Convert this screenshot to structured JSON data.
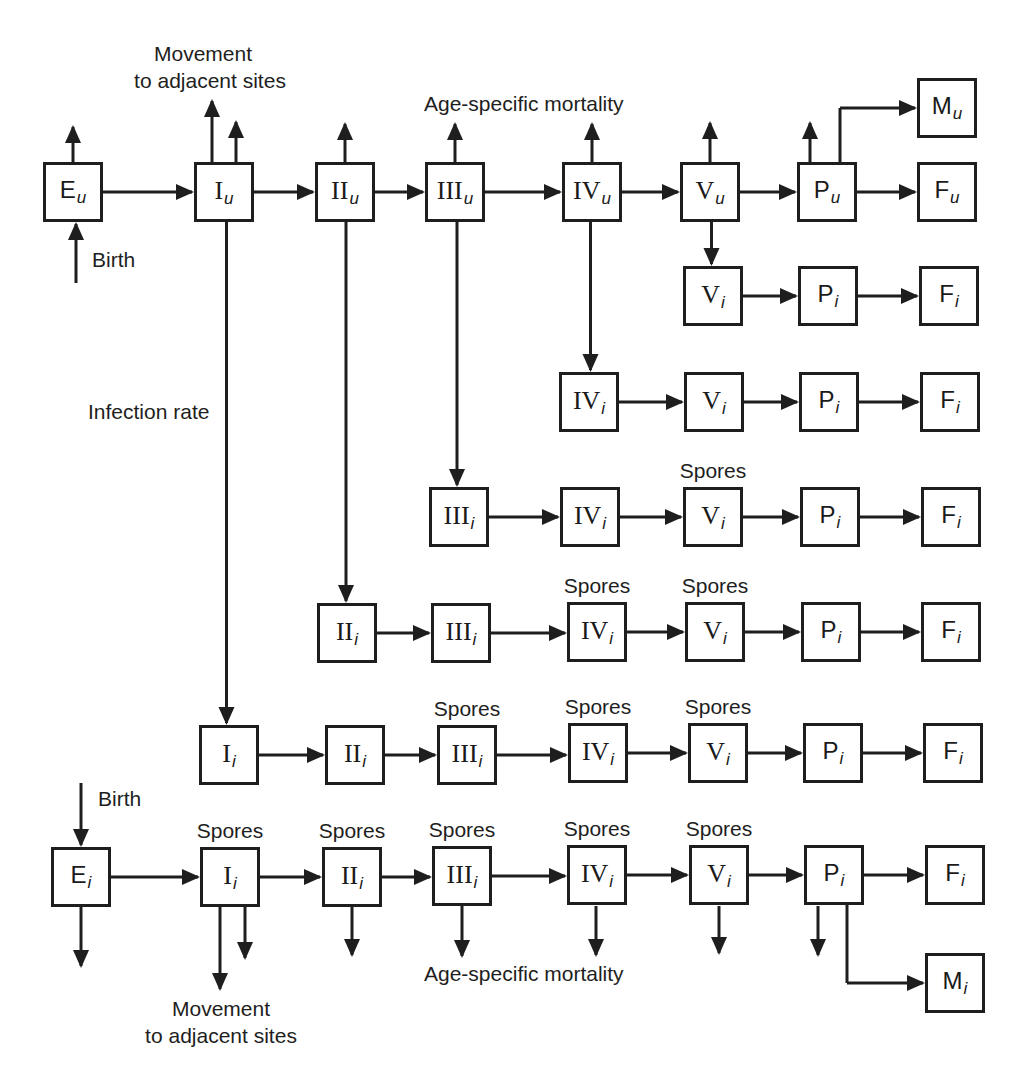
{
  "diagram": {
    "type": "compartment-flow",
    "labels": {
      "movement_top_1": "Movement",
      "movement_top_2": "to adjacent sites",
      "movement_bottom_1": "Movement",
      "movement_bottom_2": "to adjacent sites",
      "mortality_top": "Age-specific mortality",
      "mortality_bottom": "Age-specific mortality",
      "birth_top": "Birth",
      "birth_bottom": "Birth",
      "infection_rate": "Infection rate",
      "spores": "Spores"
    },
    "nodes": [
      {
        "id": "Eu",
        "main": "E",
        "sub": "u",
        "roman": false,
        "x": 73,
        "y": 192
      },
      {
        "id": "Iu",
        "main": "I",
        "sub": "u",
        "roman": true,
        "x": 224,
        "y": 192
      },
      {
        "id": "IIu",
        "main": "II",
        "sub": "u",
        "roman": true,
        "x": 345,
        "y": 192
      },
      {
        "id": "IIIu",
        "main": "III",
        "sub": "u",
        "roman": true,
        "x": 455,
        "y": 192
      },
      {
        "id": "IVu",
        "main": "IV",
        "sub": "u",
        "roman": true,
        "x": 592,
        "y": 192
      },
      {
        "id": "Vu",
        "main": "V",
        "sub": "u",
        "roman": true,
        "x": 710,
        "y": 192
      },
      {
        "id": "Pu",
        "main": "P",
        "sub": "u",
        "roman": false,
        "x": 827,
        "y": 192
      },
      {
        "id": "Fu",
        "main": "F",
        "sub": "u",
        "roman": false,
        "x": 947,
        "y": 192
      },
      {
        "id": "Mu",
        "main": "M",
        "sub": "u",
        "roman": false,
        "x": 947,
        "y": 108
      },
      {
        "id": "r2V",
        "main": "V",
        "sub": "i",
        "roman": true,
        "x": 713,
        "y": 296
      },
      {
        "id": "r2P",
        "main": "P",
        "sub": "i",
        "roman": false,
        "x": 828,
        "y": 296
      },
      {
        "id": "r2F",
        "main": "F",
        "sub": "i",
        "roman": false,
        "x": 949,
        "y": 296
      },
      {
        "id": "r3IV",
        "main": "IV",
        "sub": "i",
        "roman": true,
        "x": 589,
        "y": 402
      },
      {
        "id": "r3V",
        "main": "V",
        "sub": "i",
        "roman": true,
        "x": 714,
        "y": 402
      },
      {
        "id": "r3P",
        "main": "P",
        "sub": "i",
        "roman": false,
        "x": 829,
        "y": 402
      },
      {
        "id": "r3F",
        "main": "F",
        "sub": "i",
        "roman": false,
        "x": 950,
        "y": 402
      },
      {
        "id": "r4III",
        "main": "III",
        "sub": "i",
        "roman": true,
        "x": 459,
        "y": 517
      },
      {
        "id": "r4IV",
        "main": "IV",
        "sub": "i",
        "roman": true,
        "x": 590,
        "y": 517
      },
      {
        "id": "r4V",
        "main": "V",
        "sub": "i",
        "roman": true,
        "x": 713,
        "y": 517
      },
      {
        "id": "r4P",
        "main": "P",
        "sub": "i",
        "roman": false,
        "x": 830,
        "y": 517
      },
      {
        "id": "r4F",
        "main": "F",
        "sub": "i",
        "roman": false,
        "x": 951,
        "y": 517
      },
      {
        "id": "r5II",
        "main": "II",
        "sub": "i",
        "roman": true,
        "x": 347,
        "y": 633
      },
      {
        "id": "r5III",
        "main": "III",
        "sub": "i",
        "roman": true,
        "x": 461,
        "y": 633
      },
      {
        "id": "r5IV",
        "main": "IV",
        "sub": "i",
        "roman": true,
        "x": 597,
        "y": 632
      },
      {
        "id": "r5V",
        "main": "V",
        "sub": "i",
        "roman": true,
        "x": 715,
        "y": 632
      },
      {
        "id": "r5P",
        "main": "P",
        "sub": "i",
        "roman": false,
        "x": 831,
        "y": 632
      },
      {
        "id": "r5F",
        "main": "F",
        "sub": "i",
        "roman": false,
        "x": 951,
        "y": 632
      },
      {
        "id": "r6I",
        "main": "I",
        "sub": "i",
        "roman": true,
        "x": 229,
        "y": 755
      },
      {
        "id": "r6II",
        "main": "II",
        "sub": "i",
        "roman": true,
        "x": 355,
        "y": 755
      },
      {
        "id": "r6III",
        "main": "III",
        "sub": "i",
        "roman": true,
        "x": 467,
        "y": 755
      },
      {
        "id": "r6IV",
        "main": "IV",
        "sub": "i",
        "roman": true,
        "x": 598,
        "y": 753
      },
      {
        "id": "r6V",
        "main": "V",
        "sub": "i",
        "roman": true,
        "x": 718,
        "y": 753
      },
      {
        "id": "r6P",
        "main": "P",
        "sub": "i",
        "roman": false,
        "x": 833,
        "y": 753
      },
      {
        "id": "r6F",
        "main": "F",
        "sub": "i",
        "roman": false,
        "x": 953,
        "y": 753
      },
      {
        "id": "Ei",
        "main": "E",
        "sub": "i",
        "roman": false,
        "x": 81,
        "y": 877
      },
      {
        "id": "r7I",
        "main": "I",
        "sub": "i",
        "roman": true,
        "x": 230,
        "y": 877
      },
      {
        "id": "r7II",
        "main": "II",
        "sub": "i",
        "roman": true,
        "x": 352,
        "y": 877
      },
      {
        "id": "r7III",
        "main": "III",
        "sub": "i",
        "roman": true,
        "x": 462,
        "y": 876
      },
      {
        "id": "r7IV",
        "main": "IV",
        "sub": "i",
        "roman": true,
        "x": 597,
        "y": 875
      },
      {
        "id": "r7V",
        "main": "V",
        "sub": "i",
        "roman": true,
        "x": 719,
        "y": 875
      },
      {
        "id": "r7P",
        "main": "P",
        "sub": "i",
        "roman": false,
        "x": 834,
        "y": 875
      },
      {
        "id": "r7F",
        "main": "F",
        "sub": "i",
        "roman": false,
        "x": 955,
        "y": 875
      },
      {
        "id": "Mi",
        "main": "M",
        "sub": "i",
        "roman": false,
        "x": 955,
        "y": 983
      }
    ],
    "spores_above": [
      "r4V",
      "r5IV",
      "r5V",
      "r6III",
      "r6IV",
      "r6V",
      "r7I",
      "r7II",
      "r7III",
      "r7IV",
      "r7V"
    ],
    "edges": [
      [
        "Eu",
        "Iu"
      ],
      [
        "Iu",
        "IIu"
      ],
      [
        "IIu",
        "IIIu"
      ],
      [
        "IIIu",
        "IVu"
      ],
      [
        "IVu",
        "Vu"
      ],
      [
        "Vu",
        "Pu"
      ],
      [
        "Pu",
        "Fu"
      ],
      [
        "r2V",
        "r2P"
      ],
      [
        "r2P",
        "r2F"
      ],
      [
        "r3IV",
        "r3V"
      ],
      [
        "r3V",
        "r3P"
      ],
      [
        "r3P",
        "r3F"
      ],
      [
        "r4III",
        "r4IV"
      ],
      [
        "r4IV",
        "r4V"
      ],
      [
        "r4V",
        "r4P"
      ],
      [
        "r4P",
        "r4F"
      ],
      [
        "r5II",
        "r5III"
      ],
      [
        "r5III",
        "r5IV"
      ],
      [
        "r5IV",
        "r5V"
      ],
      [
        "r5V",
        "r5P"
      ],
      [
        "r5P",
        "r5F"
      ],
      [
        "r6I",
        "r6II"
      ],
      [
        "r6II",
        "r6III"
      ],
      [
        "r6III",
        "r6IV"
      ],
      [
        "r6IV",
        "r6V"
      ],
      [
        "r6V",
        "r6P"
      ],
      [
        "r6P",
        "r6F"
      ],
      [
        "Ei",
        "r7I"
      ],
      [
        "r7I",
        "r7II"
      ],
      [
        "r7II",
        "r7III"
      ],
      [
        "r7III",
        "r7IV"
      ],
      [
        "r7IV",
        "r7V"
      ],
      [
        "r7V",
        "r7P"
      ],
      [
        "r7P",
        "r7F"
      ]
    ],
    "infection_edges": [
      [
        "Iu",
        "r6I"
      ],
      [
        "IIu",
        "r5II"
      ],
      [
        "IIIu",
        "r4III"
      ],
      [
        "IVu",
        "r3IV"
      ],
      [
        "Vu",
        "r2V"
      ]
    ],
    "branch_edges": [
      [
        "Pu",
        "Mu"
      ],
      [
        "r7P",
        "Mi"
      ]
    ],
    "colors": {
      "stroke": "#1e1e1e",
      "background": "#ffffff"
    }
  }
}
